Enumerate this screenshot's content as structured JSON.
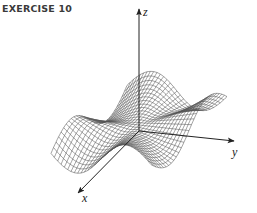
{
  "title": "EXERCISE 10",
  "figure": {
    "type": "3d-surface-wireframe",
    "axes": {
      "z": {
        "label": "z"
      },
      "y": {
        "label": "y"
      },
      "x": {
        "label": "x"
      }
    },
    "colors": {
      "mesh": "#555555",
      "axis": "#222222",
      "title": "#3a3a3a"
    },
    "mesh": {
      "grid_lines": 30,
      "domain": [
        -2,
        2
      ],
      "function": "x*y*(x^2-y^2)/(x^2+y^2)"
    }
  }
}
